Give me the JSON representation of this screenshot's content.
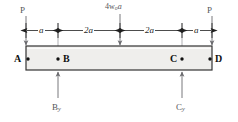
{
  "diagram": {
    "beam": {
      "label": "beam",
      "fill_color": "#efeeec",
      "border_color": "#333333"
    },
    "applied_loads": [
      {
        "name": "load-p-left",
        "label": "P",
        "direction": "down",
        "at": "A"
      },
      {
        "name": "load-p-right",
        "label": "P",
        "direction": "down",
        "at": "D"
      }
    ],
    "resultant_load": {
      "base": "4w",
      "subscript": "o",
      "suffix": "a",
      "label": "4wₒa",
      "direction": "down",
      "at": "midspan"
    },
    "dimensions": [
      {
        "name": "dim-a-left",
        "label": "a",
        "from": "A",
        "to": "B"
      },
      {
        "name": "dim-2a-left",
        "label": "2a",
        "from": "B",
        "to": "midspan"
      },
      {
        "name": "dim-2a-right",
        "label": "2a",
        "from": "midspan",
        "to": "C"
      },
      {
        "name": "dim-a-right",
        "label": "a",
        "from": "C",
        "to": "D"
      }
    ],
    "nodes": [
      {
        "name": "node-a",
        "label": "A",
        "side": "left"
      },
      {
        "name": "node-b",
        "label": "B",
        "side": "right"
      },
      {
        "name": "node-c",
        "label": "C",
        "side": "left"
      },
      {
        "name": "node-d",
        "label": "D",
        "side": "right"
      }
    ],
    "reactions": [
      {
        "name": "reaction-by",
        "base": "B",
        "subscript": "y",
        "label": "By",
        "direction": "up",
        "at": "B"
      },
      {
        "name": "reaction-cy",
        "base": "C",
        "subscript": "y",
        "label": "Cy",
        "direction": "up",
        "at": "C"
      }
    ]
  }
}
